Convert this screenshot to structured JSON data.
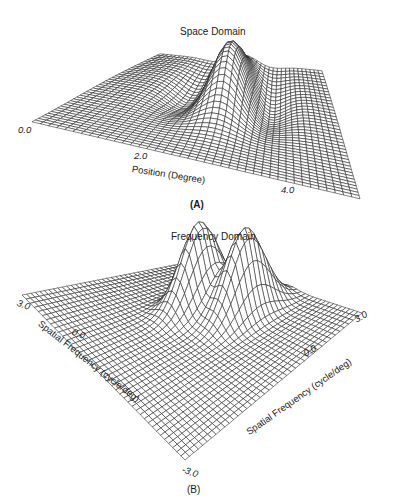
{
  "chart_data": [
    {
      "panel": "A",
      "type": "surface3d",
      "title": "Space Domain",
      "xlabel": "Position (Degree)",
      "x_ticks": [
        "0.0",
        "2.0",
        "4.0"
      ],
      "xlim": [
        0.0,
        5.0
      ],
      "ylim": [
        0.0,
        5.0
      ],
      "description": "Gabor-like receptive field in space: central positive lobe peaked near the middle (~2.5 deg), flanked by shallow negative side lobes on a flat plane",
      "grid": true,
      "panel_label": "(A)"
    },
    {
      "panel": "B",
      "type": "surface3d",
      "title": "Frequency Domain",
      "xlabel": "Spatial Frequency (cycle/deg)",
      "ylabel": "Spatial Frequency (cycle/deg)",
      "x_ticks": [
        "3.0",
        "0.0",
        "-3.0"
      ],
      "y_ticks": [
        "3.0",
        "0.0",
        "-3.0"
      ],
      "xlim": [
        -3.0,
        3.0
      ],
      "ylim": [
        -3.0,
        3.0
      ],
      "description": "Two symmetric Gaussian peaks in the 2D frequency plane (amplitude spectrum of a Gabor function)",
      "grid": true,
      "panel_label": "(B)"
    }
  ],
  "panelA": {
    "title": "Space Domain",
    "tick_0": "0.0",
    "tick_2": "2.0",
    "tick_4": "4.0",
    "axis_label": "Position (Degree)",
    "label": "(A)"
  },
  "panelB": {
    "title": "Frequency Domain",
    "tick_left_top": "3.0",
    "tick_left_mid": "0.0",
    "tick_bottom": "-3.0",
    "tick_right_top": "3.0",
    "tick_right_mid": "0.0",
    "axis_label_left": "Spatial Frequency (cycle/deg)",
    "axis_label_right": "Spatial Frequency (cycle/deg)",
    "label": "(B)"
  }
}
